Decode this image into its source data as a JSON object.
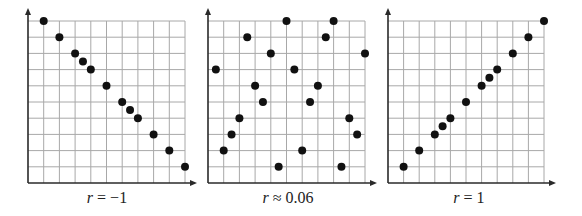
{
  "colors": {
    "grid": "#a8a8a8",
    "axis": "#2a2a2a",
    "dot": "#111111",
    "background": "#ffffff"
  },
  "chart_data": [
    {
      "type": "scatter",
      "title": "",
      "caption": "r = −1",
      "caption_var": "r",
      "caption_rest": " = −1",
      "xlabel": "",
      "ylabel": "",
      "xlim": [
        0,
        10
      ],
      "ylim": [
        0,
        10
      ],
      "grid": true,
      "grid_cells": [
        10,
        10
      ],
      "x": [
        1,
        2,
        3,
        3.5,
        4,
        5,
        6,
        6.5,
        7,
        8,
        9,
        10
      ],
      "y": [
        10,
        9,
        8,
        7.5,
        7,
        6,
        5,
        4.5,
        4,
        3,
        2,
        1
      ]
    },
    {
      "type": "scatter",
      "title": "",
      "caption": "r ≈ 0.06",
      "caption_var": "r",
      "caption_rest": " ≈ 0.06",
      "xlabel": "",
      "ylabel": "",
      "xlim": [
        0,
        10
      ],
      "ylim": [
        0,
        10
      ],
      "grid": true,
      "grid_cells": [
        10,
        10
      ],
      "x": [
        0.5,
        1,
        1.5,
        2,
        2.5,
        3,
        3.5,
        4,
        4.5,
        5,
        5.5,
        6,
        6.5,
        7,
        7.5,
        8,
        8.5,
        9,
        9.5,
        10
      ],
      "y": [
        7,
        2,
        3,
        4,
        9,
        6,
        5,
        8,
        1,
        10,
        7,
        2,
        5,
        6,
        9,
        10,
        1,
        4,
        3,
        8
      ]
    },
    {
      "type": "scatter",
      "title": "",
      "caption": "r = 1",
      "caption_var": "r",
      "caption_rest": " = 1",
      "xlabel": "",
      "ylabel": "",
      "xlim": [
        0,
        10
      ],
      "ylim": [
        0,
        10
      ],
      "grid": true,
      "grid_cells": [
        10,
        10
      ],
      "x": [
        1,
        2,
        3,
        3.5,
        4,
        5,
        6,
        6.5,
        7,
        8,
        9,
        10
      ],
      "y": [
        1,
        2,
        3,
        3.5,
        4,
        5,
        6,
        6.5,
        7,
        8,
        9,
        10
      ]
    }
  ],
  "layout": {
    "panels": [
      {
        "origin_x": 28,
        "right_x": 185,
        "caption_center": 107
      },
      {
        "origin_x": 208,
        "right_x": 365,
        "caption_center": 288
      },
      {
        "origin_x": 388,
        "right_x": 544,
        "caption_center": 469
      }
    ],
    "top_y": 21,
    "bottom_y": 183,
    "arrow_top_y": 8,
    "arrow_extra_x": 12,
    "dot_radius": 4
  }
}
